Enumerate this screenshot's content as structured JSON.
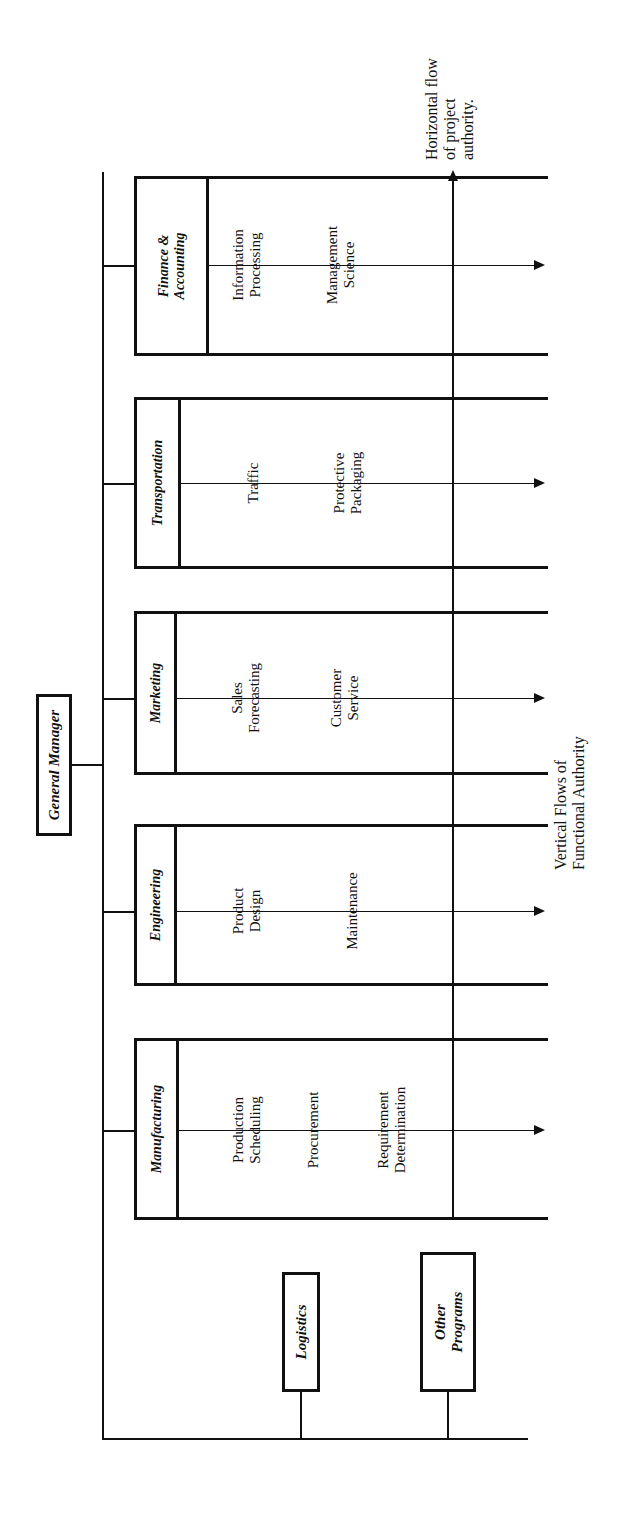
{
  "diagram": {
    "root": {
      "label": "General Manager"
    },
    "annotations": {
      "horizontal_flow": "Horizontal flow\nof project\nauthority.",
      "horizontal_flow_lines": [
        "Horizontal flow",
        "of project",
        "authority."
      ],
      "vertical_flow_lines": [
        "Vertical Flows of",
        "Functional Authority"
      ]
    },
    "functional_bands": [
      {
        "name": "Finance & Accounting",
        "name_lines": [
          "Finance &",
          "Accounting"
        ],
        "items": [
          {
            "label_lines": [
              "Information",
              "Processing"
            ]
          },
          {
            "label_lines": [
              "Management",
              "Science"
            ]
          }
        ]
      },
      {
        "name": "Transportation",
        "name_lines": [
          "Transportation"
        ],
        "items": [
          {
            "label_lines": [
              "Traffic"
            ]
          },
          {
            "label_lines": [
              "Protective",
              "Packaging"
            ]
          }
        ]
      },
      {
        "name": "Marketing",
        "name_lines": [
          "Marketing"
        ],
        "items": [
          {
            "label_lines": [
              "Sales",
              "Forecasting"
            ]
          },
          {
            "label_lines": [
              "Customer",
              "Service"
            ]
          }
        ]
      },
      {
        "name": "Engineering",
        "name_lines": [
          "Engineering"
        ],
        "items": [
          {
            "label_lines": [
              "Product",
              "Design"
            ]
          },
          {
            "label_lines": [
              "Maintenance"
            ]
          }
        ]
      },
      {
        "name": "Manufacturing",
        "name_lines": [
          "Manufacturing"
        ],
        "items": [
          {
            "label_lines": [
              "Production",
              "Scheduling"
            ]
          },
          {
            "label_lines": [
              "Procurement"
            ]
          },
          {
            "label_lines": [
              "Requirement",
              "Determination"
            ]
          }
        ]
      }
    ],
    "program_boxes": [
      {
        "label": "Logistics",
        "label_lines": [
          "Logistics"
        ]
      },
      {
        "label": "Other Programs",
        "label_lines": [
          "Other",
          "Programs"
        ]
      }
    ],
    "colors": {
      "ink": "#111111",
      "paper": "#ffffff"
    }
  }
}
